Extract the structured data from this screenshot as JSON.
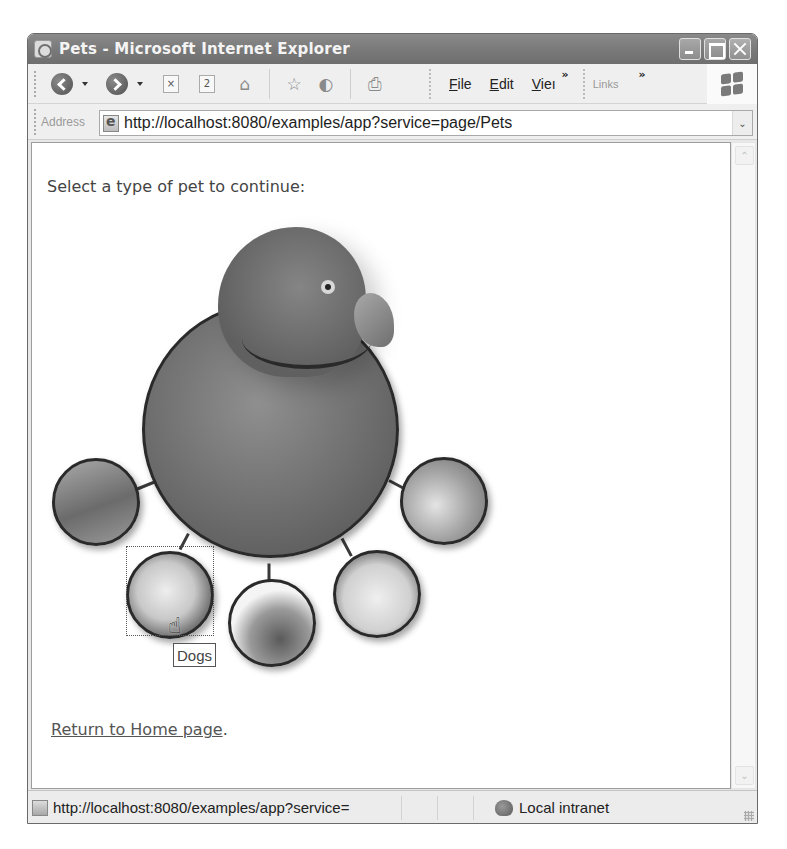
{
  "window": {
    "title": "Pets - Microsoft Internet Explorer",
    "controls": {
      "minimize": "minimize",
      "maximize": "maximize",
      "close": "close"
    }
  },
  "toolbar": {
    "buttons": [
      {
        "name": "back",
        "icon": "back-arrow-icon"
      },
      {
        "name": "forward",
        "icon": "forward-arrow-icon"
      },
      {
        "name": "stop",
        "icon": "stop-icon",
        "glyph": "×"
      },
      {
        "name": "refresh",
        "icon": "refresh-icon",
        "glyph": "2"
      },
      {
        "name": "home",
        "icon": "home-icon",
        "glyph": "⌂"
      },
      {
        "name": "favorites",
        "icon": "star-icon",
        "glyph": "☆"
      },
      {
        "name": "history",
        "icon": "history-icon",
        "glyph": "◐"
      },
      {
        "name": "print",
        "icon": "print-icon",
        "glyph": "⎙"
      }
    ],
    "menu": [
      {
        "label": "File",
        "accel": "F",
        "rest": "ile"
      },
      {
        "label": "Edit",
        "accel": "E",
        "rest": "dit"
      },
      {
        "label": "Vie",
        "accel": "V",
        "rest": "ieı"
      }
    ],
    "overflow_chevron": "»",
    "links_label": "Links"
  },
  "address": {
    "label": "Address",
    "url": "http://localhost:8080/examples/app?service=page/Pets",
    "dropdown_glyph": "⌄"
  },
  "page": {
    "prompt": "Select a type of pet to continue:",
    "pets": [
      {
        "name": "Birds",
        "position": "main",
        "icon": "parrot-image"
      },
      {
        "name": "Fish",
        "icon": "fish-image"
      },
      {
        "name": "Dogs",
        "icon": "dog-image"
      },
      {
        "name": "Reptiles",
        "icon": "reptile-image"
      },
      {
        "name": "Cats",
        "icon": "cat-image"
      },
      {
        "name": "Birds",
        "icon": "bird-image"
      }
    ],
    "tooltip": "Dogs",
    "return_link": "Return to Home page",
    "return_suffix": "."
  },
  "scrollbar": {
    "up": "⌃",
    "down": "⌄"
  },
  "status": {
    "text": "http://localhost:8080/examples/app?service=",
    "zone": "Local intranet"
  }
}
